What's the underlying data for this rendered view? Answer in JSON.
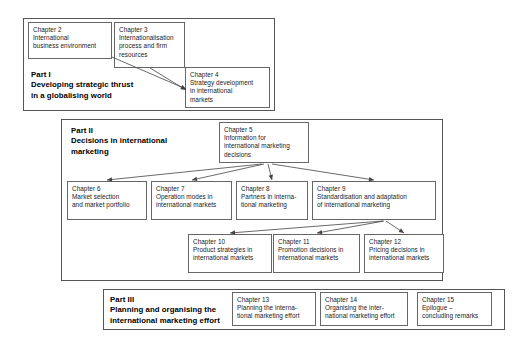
{
  "diagram": {
    "parts": [
      {
        "id": "part-1",
        "label": "Part I\nDeveloping strategic thrust\nin a globalising world",
        "box": {
          "x": 23,
          "y": 18,
          "w": 252,
          "h": 93
        }
      },
      {
        "id": "part-2",
        "label": "Part II\nDecisions in international\nmarketing",
        "box": {
          "x": 61,
          "y": 119,
          "w": 382,
          "h": 162
        }
      },
      {
        "id": "part-3",
        "label": "Part III\nPlanning and organising the\ninternational marketing effort",
        "box": {
          "x": 103,
          "y": 289,
          "w": 402,
          "h": 41
        }
      }
    ],
    "chapters": [
      {
        "id": "chapter-2",
        "number": "Chapter 2",
        "title": "International\nbusiness environment",
        "box": {
          "x": 28,
          "y": 22,
          "w": 84,
          "h": 37
        }
      },
      {
        "id": "chapter-3",
        "number": "Chapter 3",
        "title": "Internationalisation\nprocess and firm\nresources",
        "box": {
          "x": 114,
          "y": 22,
          "w": 71,
          "h": 46
        }
      },
      {
        "id": "chapter-4",
        "number": "Chapter 4",
        "title": "Strategy development\nin international\nmarkets",
        "box": {
          "x": 185,
          "y": 67,
          "w": 85,
          "h": 41
        }
      },
      {
        "id": "chapter-5",
        "number": "Chapter 5",
        "title": "Information for\ninternational marketing\ndecisions",
        "box": {
          "x": 219,
          "y": 122,
          "w": 90,
          "h": 41
        }
      },
      {
        "id": "chapter-6",
        "number": "Chapter 6",
        "title": "Market selection\nand market portfolio",
        "box": {
          "x": 67,
          "y": 181,
          "w": 80,
          "h": 39
        }
      },
      {
        "id": "chapter-7",
        "number": "Chapter 7",
        "title": "Operation modes in\ninternational markets",
        "box": {
          "x": 151,
          "y": 181,
          "w": 81,
          "h": 39
        }
      },
      {
        "id": "chapter-8",
        "number": "Chapter 8",
        "title": "Partners in interna-\ntional marketing",
        "box": {
          "x": 236,
          "y": 181,
          "w": 72,
          "h": 39
        }
      },
      {
        "id": "chapter-9",
        "number": "Chapter 9",
        "title": "Standardisation and adaptation\nof international marketing",
        "box": {
          "x": 312,
          "y": 181,
          "w": 124,
          "h": 39
        }
      },
      {
        "id": "chapter-10",
        "number": "Chapter 10",
        "title": "Product strategies in\ninternational markets",
        "box": {
          "x": 188,
          "y": 234,
          "w": 84,
          "h": 39
        }
      },
      {
        "id": "chapter-11",
        "number": "Chapter 11",
        "title": "Promotion decisions in\ninternational markets",
        "box": {
          "x": 273,
          "y": 234,
          "w": 87,
          "h": 39
        }
      },
      {
        "id": "chapter-12",
        "number": "Chapter 12",
        "title": "Pricing decisions in\ninternational markets",
        "box": {
          "x": 364,
          "y": 234,
          "w": 80,
          "h": 39
        }
      },
      {
        "id": "chapter-13",
        "number": "Chapter 13",
        "title": "Planning the interna-\ntional marketing effort",
        "box": {
          "x": 232,
          "y": 292,
          "w": 84,
          "h": 34
        }
      },
      {
        "id": "chapter-14",
        "number": "Chapter 14",
        "title": "Organising the inter-\nnational marketing effort",
        "box": {
          "x": 320,
          "y": 292,
          "w": 88,
          "h": 34
        }
      },
      {
        "id": "chapter-15",
        "number": "Chapter 15",
        "title": "Epilogue –\nconcluding remarks",
        "box": {
          "x": 417,
          "y": 292,
          "w": 75,
          "h": 34
        }
      }
    ],
    "part_labels": [
      {
        "id": "part-1-label",
        "x": 31,
        "y": 70
      },
      {
        "id": "part-2-label",
        "x": 71,
        "y": 126
      },
      {
        "id": "part-3-label",
        "x": 110,
        "y": 295
      }
    ],
    "arrows": [
      {
        "id": "arrow-ch2-to-ch4",
        "from": [
          112,
          57
        ],
        "to": [
          186,
          89
        ]
      },
      {
        "id": "arrow-ch3-to-ch4",
        "from": [
          150,
          68
        ],
        "to": [
          186,
          90
        ]
      },
      {
        "id": "arrow-ch5-to-ch6",
        "from": [
          262,
          164
        ],
        "to": [
          107,
          180
        ]
      },
      {
        "id": "arrow-ch5-to-ch7",
        "from": [
          264,
          164
        ],
        "to": [
          192,
          180
        ]
      },
      {
        "id": "arrow-ch5-to-ch8",
        "from": [
          268,
          164
        ],
        "to": [
          272,
          180
        ]
      },
      {
        "id": "arrow-ch5-to-ch9",
        "from": [
          272,
          164
        ],
        "to": [
          374,
          180
        ]
      },
      {
        "id": "arrow-ch9-to-ch10",
        "from": [
          383,
          221
        ],
        "to": [
          230,
          233
        ]
      },
      {
        "id": "arrow-ch9-to-ch11",
        "from": [
          384,
          221
        ],
        "to": [
          317,
          233
        ]
      },
      {
        "id": "arrow-ch9-to-ch12",
        "from": [
          386,
          221
        ],
        "to": [
          404,
          233
        ]
      }
    ],
    "colors": {
      "box_border": "#666666",
      "part_border": "#555555",
      "arrow": "#444444",
      "text": "#1a1a1a",
      "background": "#ffffff"
    }
  }
}
